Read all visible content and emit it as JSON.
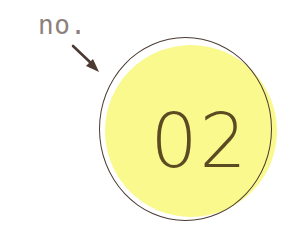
{
  "canvas": {
    "width": 288,
    "height": 248,
    "background_color": "#ffffff"
  },
  "annotation": {
    "label": "no.",
    "label_color": "#8c817c",
    "arrow": {
      "icon": "arrow-down-right-icon",
      "color": "#4b3b33",
      "direction": "down-right",
      "from": [
        75,
        50
      ],
      "to": [
        97,
        71
      ]
    }
  },
  "badge": {
    "number": "02",
    "number_color": "#5c4b22",
    "fill_color": "#f9f98d",
    "outline_color": "#4b3b33",
    "shape": "circle"
  }
}
